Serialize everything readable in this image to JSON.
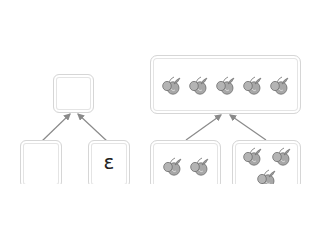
{
  "left_bond": {
    "whole": "",
    "parts": [
      "",
      "ε"
    ]
  },
  "right_bond": {
    "whole_count": 5,
    "part_counts": [
      2,
      3
    ],
    "icon": "fruit-icon"
  },
  "colors": {
    "box_border": "#d6d6d6",
    "arrow": "#8a8a8a",
    "fruit": "#9a9a9a"
  }
}
